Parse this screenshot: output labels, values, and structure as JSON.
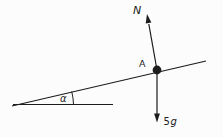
{
  "diagram": {
    "type": "physics-force-diagram",
    "labels": {
      "normal_force": "N",
      "contact_point": "A",
      "angle": "α",
      "weight_coefficient": "5",
      "weight_symbol": "g"
    },
    "colors": {
      "ink": "#1c1c1c",
      "background": "#fcfcfc"
    }
  }
}
